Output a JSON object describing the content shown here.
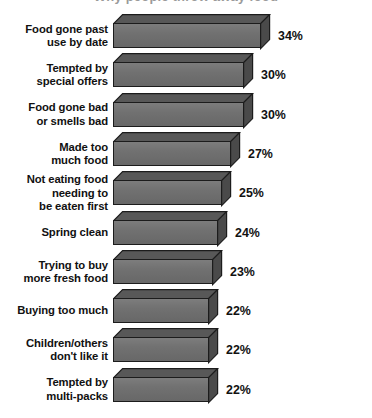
{
  "chart_data": {
    "type": "bar",
    "orientation": "horizontal",
    "title": "Why people throw away food",
    "subtitle": "",
    "xlabel": "",
    "ylabel": "",
    "value_suffix": "%",
    "xlim": [
      0,
      34
    ],
    "grid": false,
    "legend": null,
    "style": "3d-horizontal-bars",
    "categories": [
      "Food gone past use by date",
      "Tempted by special offers",
      "Food gone bad or smells bad",
      "Made too much food",
      "Not eating food needing to be eaten first",
      "Spring clean",
      "Trying to buy more fresh food",
      "Buying too much",
      "Children/others don't like it",
      "Tempted by multi-packs"
    ],
    "values": [
      34,
      30,
      30,
      27,
      25,
      24,
      23,
      22,
      22,
      22
    ],
    "data_labels": [
      "34%",
      "30%",
      "30%",
      "27%",
      "25%",
      "24%",
      "23%",
      "22%",
      "22%",
      "22%"
    ]
  },
  "rows": [
    {
      "label_lines": [
        "Food gone past",
        "use by date"
      ],
      "value": 34,
      "data_label": "34%"
    },
    {
      "label_lines": [
        "Tempted by",
        "special offers"
      ],
      "value": 30,
      "data_label": "30%"
    },
    {
      "label_lines": [
        "Food gone bad",
        "or smells bad"
      ],
      "value": 30,
      "data_label": "30%"
    },
    {
      "label_lines": [
        "Made too",
        "much food"
      ],
      "value": 27,
      "data_label": "27%"
    },
    {
      "label_lines": [
        "Not eating food",
        "needing to",
        "be eaten first"
      ],
      "value": 25,
      "data_label": "25%"
    },
    {
      "label_lines": [
        "Spring clean"
      ],
      "value": 24,
      "data_label": "24%"
    },
    {
      "label_lines": [
        "Trying to buy",
        "more fresh food"
      ],
      "value": 23,
      "data_label": "23%"
    },
    {
      "label_lines": [
        "Buying too much"
      ],
      "value": 22,
      "data_label": "22%"
    },
    {
      "label_lines": [
        "Children/others",
        "don't like it"
      ],
      "value": 22,
      "data_label": "22%"
    },
    {
      "label_lines": [
        "Tempted by",
        "multi-packs"
      ],
      "value": 22,
      "data_label": "22%"
    }
  ],
  "colors": {
    "bar_front": "#6e6e6e",
    "bar_top": "#585858",
    "bar_side": "#4a4a4a",
    "bar_outline": "#1c1c1c",
    "text": "#111111",
    "background": "#ffffff",
    "title_faded": "#9a9a9a"
  },
  "geometry": {
    "bar_left_px": 113,
    "bar_height_px": 25,
    "depth_px": 9,
    "px_per_unit": 4.32,
    "row_pitch_px": 39.3,
    "first_row_top_px": 14
  }
}
